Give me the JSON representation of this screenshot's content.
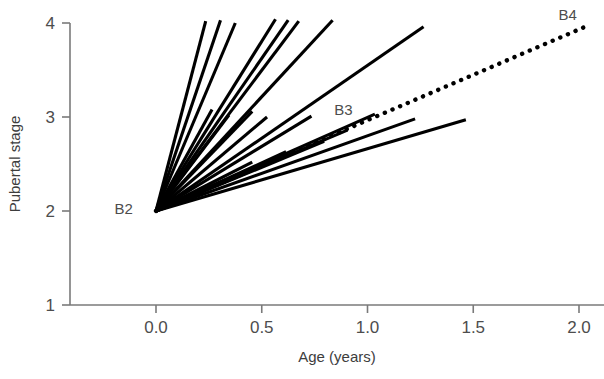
{
  "chart_data": {
    "type": "line",
    "title": "",
    "subtitle": "",
    "xlabel": "Age (years)",
    "ylabel": "Pubertal stage",
    "xlim": [
      -0.32,
      2.15
    ],
    "ylim": [
      1,
      4.12
    ],
    "xticks": [
      0.0,
      0.5,
      1.0,
      1.5,
      2.0
    ],
    "xticklabels": [
      "0.0",
      "0.5",
      "1.0",
      "1.5",
      "2.0"
    ],
    "yticks": [
      1,
      2,
      3,
      4
    ],
    "yticklabels": [
      "1",
      "2",
      "3",
      "4"
    ],
    "grid": false,
    "legend": "none",
    "origin": {
      "x": 0.0,
      "y": 2.0
    },
    "annotations": [
      {
        "text": "B2",
        "x": -0.11,
        "y": 2.02,
        "anchor": "end"
      },
      {
        "text": "B3",
        "x": 0.93,
        "y": 3.07,
        "anchor": "end"
      },
      {
        "text": "B4",
        "x": 1.99,
        "y": 4.08,
        "anchor": "end"
      }
    ],
    "series": [
      {
        "name": "reference",
        "style": "dotted",
        "points": [
          [
            0.0,
            2.0
          ],
          [
            2.05,
            3.98
          ]
        ]
      },
      {
        "name": "subject-01",
        "style": "solid",
        "points": [
          [
            0.0,
            2.0
          ],
          [
            0.235,
            4.02
          ]
        ]
      },
      {
        "name": "subject-02",
        "style": "solid",
        "points": [
          [
            0.0,
            2.0
          ],
          [
            0.305,
            4.03
          ]
        ]
      },
      {
        "name": "subject-03",
        "style": "solid",
        "points": [
          [
            0.0,
            2.0
          ],
          [
            0.375,
            4.0
          ]
        ]
      },
      {
        "name": "subject-04",
        "style": "solid",
        "points": [
          [
            0.0,
            2.0
          ],
          [
            0.565,
            4.04
          ]
        ]
      },
      {
        "name": "subject-05",
        "style": "solid",
        "points": [
          [
            0.0,
            2.0
          ],
          [
            0.625,
            4.03
          ]
        ]
      },
      {
        "name": "subject-06",
        "style": "solid",
        "points": [
          [
            0.0,
            2.0
          ],
          [
            0.675,
            4.02
          ]
        ]
      },
      {
        "name": "subject-07",
        "style": "solid",
        "points": [
          [
            0.0,
            2.0
          ],
          [
            0.835,
            4.03
          ]
        ]
      },
      {
        "name": "subject-08",
        "style": "solid",
        "points": [
          [
            0.0,
            2.0
          ],
          [
            1.265,
            3.96
          ]
        ]
      },
      {
        "name": "subject-09",
        "style": "solid",
        "points": [
          [
            0.0,
            2.0
          ],
          [
            0.265,
            3.08
          ]
        ]
      },
      {
        "name": "subject-10",
        "style": "solid",
        "points": [
          [
            0.0,
            2.0
          ],
          [
            0.345,
            3.02
          ]
        ]
      },
      {
        "name": "subject-11",
        "style": "solid",
        "points": [
          [
            0.0,
            2.0
          ],
          [
            0.455,
            3.06
          ]
        ]
      },
      {
        "name": "subject-12",
        "style": "solid",
        "points": [
          [
            0.0,
            2.0
          ],
          [
            0.525,
            3.0
          ]
        ]
      },
      {
        "name": "subject-13",
        "style": "solid",
        "points": [
          [
            0.0,
            2.0
          ],
          [
            0.735,
            3.01
          ]
        ]
      },
      {
        "name": "subject-14",
        "style": "solid",
        "points": [
          [
            0.0,
            2.0
          ],
          [
            0.905,
            2.86
          ]
        ]
      },
      {
        "name": "subject-15",
        "style": "solid",
        "points": [
          [
            0.0,
            2.0
          ],
          [
            1.035,
            3.03
          ]
        ]
      },
      {
        "name": "subject-16",
        "style": "solid",
        "points": [
          [
            0.0,
            2.0
          ],
          [
            1.225,
            2.98
          ]
        ]
      },
      {
        "name": "subject-17",
        "style": "solid",
        "points": [
          [
            0.0,
            2.0
          ],
          [
            1.465,
            2.97
          ]
        ]
      },
      {
        "name": "subject-18",
        "style": "solid",
        "points": [
          [
            0.0,
            2.0
          ],
          [
            0.455,
            2.52
          ]
        ]
      },
      {
        "name": "subject-19",
        "style": "solid",
        "points": [
          [
            0.0,
            2.0
          ],
          [
            0.615,
            2.63
          ]
        ]
      },
      {
        "name": "subject-20",
        "style": "solid",
        "points": [
          [
            0.0,
            2.0
          ],
          [
            0.795,
            2.74
          ]
        ]
      }
    ],
    "colors": {
      "line": "#000000",
      "axis": "#7a7a7a",
      "text": "#4d4d4d",
      "background": "#ffffff"
    }
  }
}
